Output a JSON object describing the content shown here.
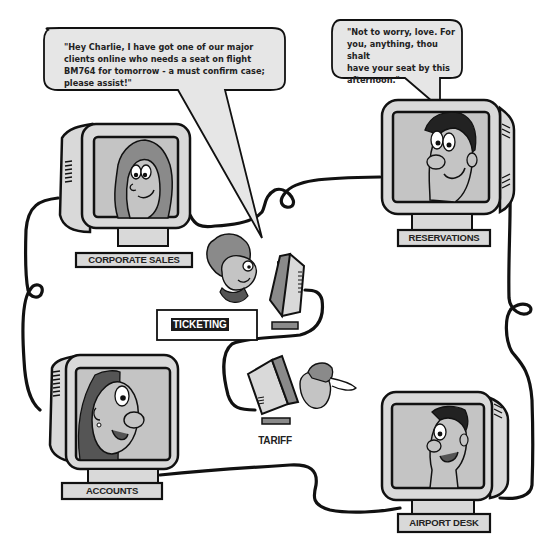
{
  "colors": {
    "outline": "#111111",
    "monitor_body": "#d9d9d9",
    "screen": "#c4c4c4",
    "hair_dark": "#555555",
    "hair_mid": "#8a8a8a",
    "bubble_fill": "#e6e6e6",
    "background": "#ffffff"
  },
  "speech_bubbles": [
    {
      "speaker": "Corporate Sales",
      "text_lines": [
        "\"Hey Charlie, I have got one of our major",
        "clients online who needs a seat on flight",
        "BM764 for tomorrow - a must confirm case;",
        "please assist!\""
      ]
    },
    {
      "speaker": "Reservations",
      "text_lines": [
        "\"Not to worry, love. For",
        "you, anything, thou shalt",
        "have your seat by this",
        "afternoon.\""
      ]
    }
  ],
  "stations": {
    "corporate_sales": {
      "label": "CORPORATE SALES"
    },
    "reservations": {
      "label": "RESERVATIONS"
    },
    "ticketing": {
      "label": "TICKETING"
    },
    "tariff": {
      "label": "TARIFF"
    },
    "accounts": {
      "label": "ACCOUNTS"
    },
    "airport_desk": {
      "label": "AIRPORT DESK"
    }
  }
}
